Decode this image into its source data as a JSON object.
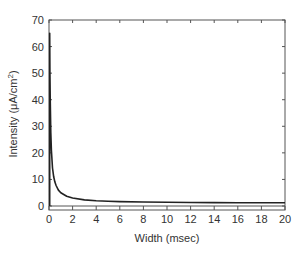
{
  "chart_data": {
    "type": "line",
    "title": "",
    "xlabel": "Width (msec)",
    "ylabel": "Intensity (μA/cm²)",
    "xlim": [
      0,
      20
    ],
    "ylim": [
      0,
      70
    ],
    "x_ticks": [
      0,
      2,
      4,
      6,
      8,
      10,
      12,
      14,
      16,
      18,
      20
    ],
    "y_ticks": [
      0,
      10,
      20,
      30,
      40,
      50,
      60,
      70
    ],
    "grid": false,
    "legend": null,
    "series": [
      {
        "name": "strength-duration curve",
        "x": [
          0.06,
          0.08,
          0.1,
          0.15,
          0.2,
          0.3,
          0.4,
          0.5,
          0.6,
          0.8,
          1.0,
          1.5,
          2,
          3,
          4,
          5,
          6,
          8,
          10,
          12,
          14,
          16,
          18,
          20
        ],
        "y": [
          65,
          51,
          41,
          27.7,
          21,
          14.3,
          11,
          9,
          7.7,
          6,
          5,
          3.7,
          3,
          2.3,
          2,
          1.8,
          1.67,
          1.5,
          1.4,
          1.33,
          1.29,
          1.25,
          1.22,
          1.2
        ]
      }
    ],
    "reference_lines": [
      {
        "y": 0
      }
    ]
  },
  "colors": {
    "line": "#222222",
    "axis": "#555555",
    "text": "#333333"
  },
  "axis": {
    "xlabel": "Width (msec)",
    "ylabel_main": "Intensity (μA/cm",
    "ylabel_sup": "2",
    "ylabel_close": ")"
  }
}
